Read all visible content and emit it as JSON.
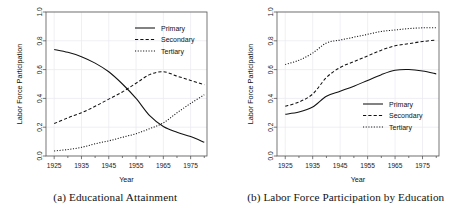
{
  "figure": {
    "panels": [
      {
        "key": "a",
        "caption": "(a) Educational Attainment",
        "xlabel": "Year",
        "ylabel": "Labor Force Participation",
        "legend": {
          "position": "top-right"
        }
      },
      {
        "key": "b",
        "caption": "(b) Labor Force Participation by Education",
        "xlabel": "Year",
        "ylabel": "Labor Force Participation",
        "legend": {
          "position": "middle-right"
        }
      }
    ]
  },
  "chart_data": [
    {
      "type": "line",
      "title": "(a) Educational Attainment",
      "xlabel": "Year",
      "ylabel": "Labor Force Participation",
      "xlim": [
        1922,
        1981
      ],
      "ylim": [
        0.0,
        1.0
      ],
      "xticks": [
        1925,
        1935,
        1945,
        1955,
        1965,
        1975
      ],
      "yticks": [
        0.0,
        0.2,
        0.4,
        0.6,
        0.8,
        1.0
      ],
      "xticklabels": [
        "1925",
        "1935",
        "1945",
        "1955",
        "1965",
        "1975"
      ],
      "yticklabels": [
        "0.0",
        "0.2",
        "0.4",
        "0.6",
        "0.8",
        "1.0"
      ],
      "grid": true,
      "legend_position": "top-right",
      "x": [
        1925,
        1930,
        1935,
        1940,
        1945,
        1950,
        1955,
        1960,
        1965,
        1970,
        1975,
        1980
      ],
      "series": [
        {
          "name": "Primary",
          "style": "solid",
          "values": [
            0.74,
            0.72,
            0.69,
            0.645,
            0.585,
            0.5,
            0.4,
            0.28,
            0.205,
            0.165,
            0.135,
            0.095
          ]
        },
        {
          "name": "Secondary",
          "style": "dashed",
          "values": [
            0.225,
            0.265,
            0.3,
            0.345,
            0.395,
            0.445,
            0.505,
            0.565,
            0.585,
            0.555,
            0.525,
            0.495
          ]
        },
        {
          "name": "Tertiary",
          "style": "dotted",
          "values": [
            0.035,
            0.045,
            0.06,
            0.085,
            0.105,
            0.13,
            0.155,
            0.19,
            0.23,
            0.3,
            0.365,
            0.425
          ]
        }
      ]
    },
    {
      "type": "line",
      "title": "(b) Labor Force Participation by Education",
      "xlabel": "Year",
      "ylabel": "Labor Force Participation",
      "xlim": [
        1922,
        1981
      ],
      "ylim": [
        0.0,
        1.0
      ],
      "xticks": [
        1925,
        1935,
        1945,
        1955,
        1965,
        1975
      ],
      "yticks": [
        0.0,
        0.2,
        0.4,
        0.6,
        0.8,
        1.0
      ],
      "xticklabels": [
        "1925",
        "1935",
        "1945",
        "1955",
        "1965",
        "1975"
      ],
      "yticklabels": [
        "0.0",
        "0.2",
        "0.4",
        "0.6",
        "0.8",
        "1.0"
      ],
      "grid": true,
      "legend_position": "middle-right",
      "x": [
        1925,
        1930,
        1935,
        1940,
        1945,
        1950,
        1955,
        1960,
        1965,
        1970,
        1975,
        1980
      ],
      "series": [
        {
          "name": "Primary",
          "style": "solid",
          "values": [
            0.29,
            0.305,
            0.34,
            0.415,
            0.45,
            0.485,
            0.525,
            0.565,
            0.595,
            0.6,
            0.59,
            0.57
          ]
        },
        {
          "name": "Secondary",
          "style": "dashed",
          "values": [
            0.345,
            0.375,
            0.43,
            0.545,
            0.615,
            0.655,
            0.695,
            0.735,
            0.765,
            0.78,
            0.795,
            0.805
          ]
        },
        {
          "name": "Tertiary",
          "style": "dotted",
          "values": [
            0.635,
            0.665,
            0.715,
            0.785,
            0.805,
            0.825,
            0.845,
            0.865,
            0.875,
            0.885,
            0.89,
            0.89
          ]
        }
      ]
    }
  ],
  "legend_items": [
    {
      "label": "Primary",
      "style": "solid"
    },
    {
      "label": "Secondary",
      "style": "dashed"
    },
    {
      "label": "Tertiary",
      "style": "dotted"
    }
  ],
  "colors": {
    "ink": "#111111",
    "axis": "#555555",
    "grid": "#e9e9ef"
  }
}
